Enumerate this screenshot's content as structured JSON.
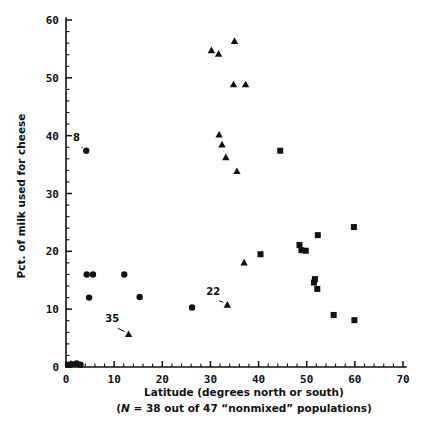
{
  "chart_data": {
    "type": "scatter",
    "title": "",
    "xlabel": "Latitude (degrees north or south)",
    "sublabel_parts": {
      "open": "(",
      "italic_n": "N",
      "rest": " = 38 out of 47 “nonmixed” populations)"
    },
    "sublabel": "(N = 38 out of 47 “nonmixed” populations)",
    "ylabel": "Pct. of milk used for cheese",
    "xlim": [
      0,
      70
    ],
    "ylim": [
      0,
      60
    ],
    "xticks": [
      0,
      10,
      20,
      30,
      40,
      50,
      60,
      70
    ],
    "xtick_labels": [
      "0",
      "10",
      "20",
      "30",
      "40",
      "50",
      "60",
      "70"
    ],
    "yticks": [
      0,
      10,
      20,
      30,
      40,
      50,
      60
    ],
    "ytick_labels": [
      "0",
      "10",
      "20",
      "30",
      "40",
      "50",
      "60"
    ],
    "x_minor_step": 2,
    "y_minor_step": 2,
    "grid": false,
    "legend": "none",
    "marker_color": "#111111",
    "series": [
      {
        "name": "circle-group",
        "marker": "circle",
        "points": [
          {
            "x": 0.4,
            "y": 0.4
          },
          {
            "x": 1.2,
            "y": 0.5
          },
          {
            "x": 2.2,
            "y": 0.6
          },
          {
            "x": 3.0,
            "y": 0.4
          },
          {
            "x": 4.2,
            "y": 37.4
          },
          {
            "x": 4.3,
            "y": 16.0
          },
          {
            "x": 5.6,
            "y": 16.0
          },
          {
            "x": 4.8,
            "y": 12.0
          },
          {
            "x": 12.1,
            "y": 16.0
          },
          {
            "x": 15.3,
            "y": 12.1
          },
          {
            "x": 26.2,
            "y": 10.3
          }
        ]
      },
      {
        "name": "triangle-group",
        "marker": "triangle",
        "points": [
          {
            "x": 1.0,
            "y": 0.5
          },
          {
            "x": 13.0,
            "y": 5.6
          },
          {
            "x": 33.5,
            "y": 10.7
          },
          {
            "x": 37.0,
            "y": 18.0
          },
          {
            "x": 35.5,
            "y": 33.8
          },
          {
            "x": 33.2,
            "y": 36.2
          },
          {
            "x": 32.4,
            "y": 38.4
          },
          {
            "x": 31.8,
            "y": 40.1
          },
          {
            "x": 34.8,
            "y": 48.8
          },
          {
            "x": 37.3,
            "y": 48.8
          },
          {
            "x": 30.2,
            "y": 54.7
          },
          {
            "x": 31.7,
            "y": 54.1
          },
          {
            "x": 35.0,
            "y": 56.3
          }
        ]
      },
      {
        "name": "square-group",
        "marker": "square",
        "points": [
          {
            "x": 40.4,
            "y": 19.5
          },
          {
            "x": 44.5,
            "y": 37.4
          },
          {
            "x": 48.5,
            "y": 21.1
          },
          {
            "x": 48.9,
            "y": 20.2
          },
          {
            "x": 49.8,
            "y": 20.1
          },
          {
            "x": 52.3,
            "y": 22.8
          },
          {
            "x": 51.7,
            "y": 15.2
          },
          {
            "x": 51.5,
            "y": 14.6
          },
          {
            "x": 52.2,
            "y": 13.5
          },
          {
            "x": 55.6,
            "y": 9.0
          },
          {
            "x": 59.8,
            "y": 24.2
          },
          {
            "x": 59.9,
            "y": 8.1
          }
        ]
      }
    ],
    "annotations": [
      {
        "label": "8",
        "label_x": 2.2,
        "label_y": 39.1,
        "point_x": 4.2,
        "point_y": 37.4
      },
      {
        "label": "22",
        "label_x": 30.6,
        "label_y": 12.5,
        "point_x": 33.5,
        "point_y": 10.7
      },
      {
        "label": "35",
        "label_x": 9.6,
        "label_y": 7.8,
        "point_x": 13.0,
        "point_y": 5.6
      }
    ]
  }
}
